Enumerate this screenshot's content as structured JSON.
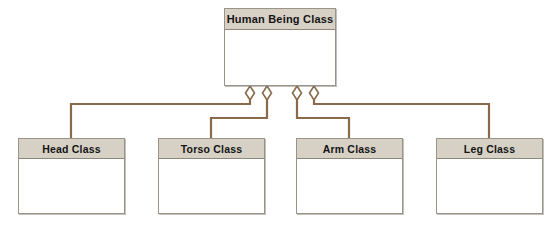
{
  "diagram": {
    "type": "uml-class-diagram",
    "relationship": "aggregation",
    "background_color": "#ffffff",
    "header_fill_color": "#d7d1c5",
    "box_border_color": "#9a9488",
    "connector_color": "#8a6a4a",
    "diamond_fill_color": "#ffffff",
    "parent": {
      "name": "Human Being Class",
      "label": "Human Being Class"
    },
    "children": [
      {
        "name": "head-class",
        "label": "Head Class"
      },
      {
        "name": "torso-class",
        "label": "Torso Class"
      },
      {
        "name": "arm-class",
        "label": "Arm Class"
      },
      {
        "name": "leg-class",
        "label": "Leg Class"
      }
    ],
    "diamonds": [
      {
        "name": "aggregation-diamond-head",
        "x": 250
      },
      {
        "name": "aggregation-diamond-torso",
        "x": 267
      },
      {
        "name": "aggregation-diamond-arm",
        "x": 297
      },
      {
        "name": "aggregation-diamond-leg",
        "x": 314
      }
    ]
  }
}
